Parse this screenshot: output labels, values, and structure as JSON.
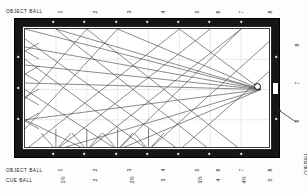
{
  "diagram": {
    "type": "pool-table-aiming-diagram"
  },
  "labels": {
    "object_ball": "OBJECT BALL",
    "cue_ball": "CUE BALL"
  },
  "top_scale": {
    "label": "OBJECT BALL",
    "values": [
      "1",
      "2",
      "3",
      "4",
      "5",
      "6",
      "7",
      "8"
    ]
  },
  "bottom_scale_object": {
    "label": "OBJECT BALL",
    "values": [
      "1",
      "2",
      "3",
      "4",
      "5",
      "6",
      "7",
      "8"
    ]
  },
  "bottom_scale_cue": {
    "label": "CUE BALL",
    "values": [
      "1½",
      "2",
      "2½",
      "3",
      "3½",
      "4",
      "4½",
      "5"
    ]
  },
  "right_scale_cue": {
    "label": "CUE BALL",
    "values": [
      "8",
      "7",
      "6"
    ]
  },
  "colors": {
    "rail": "#161616",
    "bed": "#ffffff",
    "line": "#3c3c3c",
    "grid": "#d4d4d4",
    "ball": "#ffffff",
    "text": "#1a1a1a"
  },
  "markers": {
    "top_diamond_count": 7,
    "bottom_diamond_count": 7,
    "left_diamond_count": 3,
    "right_diamond_count": 3
  },
  "ball_position": {
    "x_pct": 95.5,
    "y_pct": 50.0
  },
  "pocket": {
    "side": "right",
    "label": ""
  }
}
